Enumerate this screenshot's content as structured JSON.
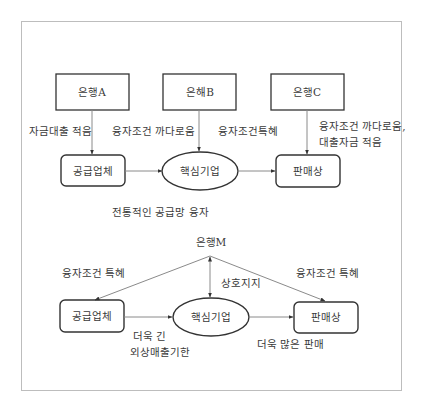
{
  "top": {
    "banks": [
      "은행A",
      "은해B",
      "은행C"
    ],
    "nodes": {
      "supplier": "공급업체",
      "core": "핵심기업",
      "retailer": "판매상"
    },
    "edge_labels": {
      "bank_a": "자금대출 적음",
      "bank_b_left": "융자조건 까다로움",
      "bank_b_right": "융자조건특혜",
      "bank_c_line1": "융자조건 까다로움,",
      "bank_c_line2": "대출자금 적음"
    },
    "caption": "전통적인 공급망 융자"
  },
  "bottom": {
    "bank": "은행M",
    "nodes": {
      "supplier": "공급업체",
      "core": "핵심기업",
      "retailer": "판매상"
    },
    "edge_labels": {
      "left": "융자조건 특혜",
      "right": "융자조건 특혜",
      "mutual": "상호지지",
      "supplier_core_line1": "더욱 긴",
      "supplier_core_line2": "외상매출기한",
      "core_retailer": "더욱 많은 판매"
    }
  },
  "colors": {
    "line": "#8a8a8a",
    "box": "#333333",
    "frame": "#bdbdbd"
  }
}
